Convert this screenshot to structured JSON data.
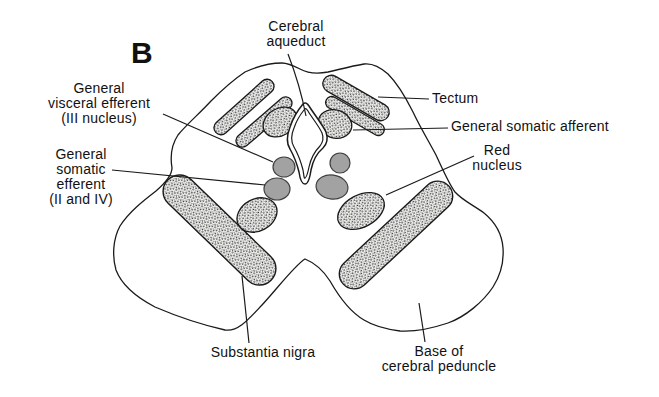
{
  "figure": {
    "panel_letter": "B",
    "labels": {
      "cerebral_aqueduct": "Cerebral\naqueduct",
      "general_visceral_efferent": "General\nvisceral efferent\n(III nucleus)",
      "general_somatic_efferent": "General\nsomatic\nefferent\n(II and IV)",
      "tectum": "Tectum",
      "general_somatic_afferent": "General somatic afferent",
      "red_nucleus": "Red\nnucleus",
      "substantia_nigra": "Substantia nigra",
      "base_of_cerebral_peduncle": "Base of\ncerebral peduncle"
    },
    "colors": {
      "ink": "#1a1a1a",
      "nucleus_gray": "#a2a2a2",
      "stipple_background": "#f3f3f1",
      "background": "#ffffff"
    }
  }
}
